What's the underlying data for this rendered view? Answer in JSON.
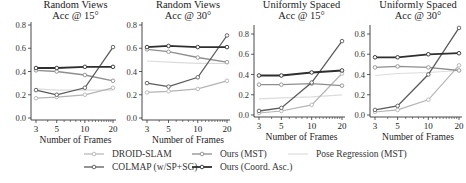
{
  "chart_data": [
    {
      "type": "line",
      "title": "Random Views\nAcc @ 15°",
      "title_lines": [
        "Random Views",
        "Acc @ 15°"
      ],
      "xlabel": "Number of Frames",
      "ylabel": "",
      "x": [
        3,
        5,
        10,
        20
      ],
      "xscale": "log",
      "xticks": [
        "3",
        "5",
        "10",
        "20"
      ],
      "yticks": [
        "0.0",
        "0.2",
        "0.4",
        "0.6",
        "0.8"
      ],
      "ylim": [
        0,
        0.8
      ],
      "grid": false,
      "series": [
        {
          "name": "Pose Regression (MST)",
          "values": [
            0.25,
            0.24,
            0.24,
            0.24
          ]
        },
        {
          "name": "DROID-SLAM",
          "values": [
            0.17,
            0.18,
            0.2,
            0.26
          ]
        },
        {
          "name": "COLMAP (w/SP+SG)",
          "values": [
            0.24,
            0.2,
            0.26,
            0.61
          ]
        },
        {
          "name": "Ours (MST)",
          "values": [
            0.41,
            0.4,
            0.37,
            0.32
          ]
        },
        {
          "name": "Ours (Coord. Asc.)",
          "values": [
            0.43,
            0.43,
            0.44,
            0.44
          ]
        }
      ]
    },
    {
      "type": "line",
      "title": "Random Views\nAcc @ 30°",
      "title_lines": [
        "Random Views",
        "Acc @ 30°"
      ],
      "xlabel": "Number of Frames",
      "ylabel": "",
      "x": [
        3,
        5,
        10,
        20
      ],
      "xscale": "log",
      "xticks": [
        "3",
        "5",
        "10",
        "20"
      ],
      "yticks": [
        "0.0",
        "0.2",
        "0.4",
        "0.6",
        "0.8"
      ],
      "ylim": [
        0,
        0.8
      ],
      "grid": false,
      "series": [
        {
          "name": "Pose Regression (MST)",
          "values": [
            0.49,
            0.48,
            0.47,
            0.47
          ]
        },
        {
          "name": "DROID-SLAM",
          "values": [
            0.22,
            0.23,
            0.25,
            0.32
          ]
        },
        {
          "name": "COLMAP (w/SP+SG)",
          "values": [
            0.3,
            0.27,
            0.35,
            0.71
          ]
        },
        {
          "name": "Ours (MST)",
          "values": [
            0.59,
            0.57,
            0.52,
            0.48
          ]
        },
        {
          "name": "Ours (Coord. Asc.)",
          "values": [
            0.61,
            0.62,
            0.61,
            0.61
          ]
        }
      ]
    },
    {
      "type": "line",
      "title": "Uniformly Spaced\nAcc @ 15°",
      "title_lines": [
        "Uniformly Spaced",
        "Acc @ 15°"
      ],
      "xlabel": "Number of Frames",
      "ylabel": "",
      "x": [
        3,
        5,
        10,
        20
      ],
      "xscale": "log",
      "xticks": [
        "3",
        "5",
        "10",
        "20"
      ],
      "yticks": [
        "0.0",
        "0.2",
        "0.4",
        "0.6",
        "0.8"
      ],
      "ylim": [
        0,
        0.8
      ],
      "grid": false,
      "series": [
        {
          "name": "Pose Regression (MST)",
          "values": [
            0.16,
            0.17,
            0.18,
            0.2
          ]
        },
        {
          "name": "DROID-SLAM",
          "values": [
            0.02,
            0.04,
            0.1,
            0.41
          ]
        },
        {
          "name": "COLMAP (w/SP+SG)",
          "values": [
            0.04,
            0.07,
            0.32,
            0.73
          ]
        },
        {
          "name": "Ours (MST)",
          "values": [
            0.3,
            0.3,
            0.31,
            0.29
          ]
        },
        {
          "name": "Ours (Coord. Asc.)",
          "values": [
            0.39,
            0.39,
            0.42,
            0.44
          ]
        }
      ]
    },
    {
      "type": "line",
      "title": "Uniformly Spaced\nAcc @ 30°",
      "title_lines": [
        "Uniformly Spaced",
        "Acc @ 30°"
      ],
      "xlabel": "Number of Frames",
      "ylabel": "",
      "x": [
        3,
        5,
        10,
        20
      ],
      "xscale": "log",
      "xticks": [
        "3",
        "5",
        "10",
        "20"
      ],
      "yticks": [
        "0.0",
        "0.2",
        "0.4",
        "0.6",
        "0.8"
      ],
      "ylim": [
        0,
        0.8
      ],
      "grid": false,
      "series": [
        {
          "name": "Pose Regression (MST)",
          "values": [
            0.39,
            0.41,
            0.42,
            0.44
          ]
        },
        {
          "name": "DROID-SLAM",
          "values": [
            0.03,
            0.05,
            0.15,
            0.49
          ]
        },
        {
          "name": "COLMAP (w/SP+SG)",
          "values": [
            0.05,
            0.09,
            0.4,
            0.86
          ]
        },
        {
          "name": "Ours (MST)",
          "values": [
            0.47,
            0.48,
            0.47,
            0.44
          ]
        },
        {
          "name": "Ours (Coord. Asc.)",
          "values": [
            0.57,
            0.57,
            0.6,
            0.61
          ]
        }
      ]
    }
  ],
  "series_styles": {
    "Pose Regression (MST)": {
      "color": "#dcdcdc",
      "marker": false,
      "width": 1.2
    },
    "DROID-SLAM": {
      "color": "#b4b4b4",
      "marker": true,
      "width": 1.2
    },
    "COLMAP (w/SP+SG)": {
      "color": "#5a5a5a",
      "marker": true,
      "width": 1.3
    },
    "Ours (MST)": {
      "color": "#8e8e8e",
      "marker": true,
      "width": 1.3
    },
    "Ours (Coord. Asc.)": {
      "color": "#2e2e2e",
      "marker": true,
      "width": 1.8
    }
  },
  "legend": {
    "position": "bottom",
    "items": [
      {
        "label": "DROID-SLAM",
        "series": "DROID-SLAM"
      },
      {
        "label": "COLMAP (w/SP+SG)",
        "series": "COLMAP (w/SP+SG)"
      },
      {
        "label": "Ours (MST)",
        "series": "Ours (MST)"
      },
      {
        "label": "Ours (Coord. Asc.)",
        "series": "Ours (Coord. Asc.)"
      },
      {
        "label": "Pose Regression (MST)",
        "series": "Pose Regression (MST)"
      }
    ]
  }
}
